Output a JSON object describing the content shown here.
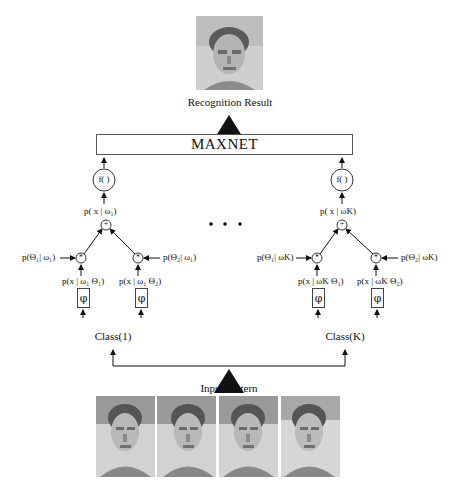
{
  "result": {
    "photo_icon": "face-photo",
    "label": "Recognition Result"
  },
  "maxnet": {
    "label": "MAXNET"
  },
  "ellipsis": "• • •",
  "classes": [
    {
      "name": "Class(1)",
      "f_label": "f( )",
      "sum_label": "p( x | ω₁)",
      "plus": "+",
      "mult": "*",
      "prior_left": "p(Θ₁| ω₁)",
      "prior_right": "p(Θ₂| ω₁)",
      "lik_left": "p(x | ω₁ Θ₁)",
      "lik_right": "p(x | ω₁ Θ₂)",
      "phi": "φ"
    },
    {
      "name": "Class(K)",
      "f_label": "f( )",
      "sum_label": "p( x | ωK)",
      "plus": "+",
      "mult": "*",
      "prior_left": "p(Θ₁| ωK)",
      "prior_right": "p(Θ₂| ωK)",
      "lik_left": "p(x | ωK Θ₁)",
      "lik_right": "p(x | ωK Θ₂)",
      "phi": "φ"
    }
  ],
  "input": {
    "label": "Input Pattern",
    "photos": [
      "face-photo-1",
      "face-photo-2",
      "face-photo-3",
      "face-photo-4"
    ]
  }
}
